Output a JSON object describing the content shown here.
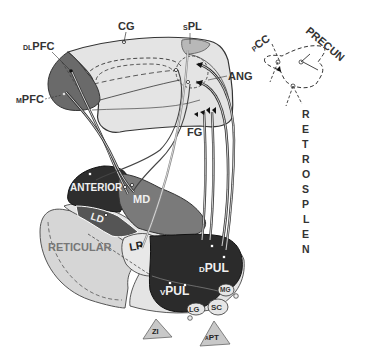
{
  "diagram": {
    "type": "anatomical-connectivity",
    "colors": {
      "cortex_fill": "#e4e4e4",
      "pfc_fill": "#6a6a6a",
      "anterior_fill": "#2e2e2e",
      "md_fill": "#7a7a7a",
      "ld_fill": "#555555",
      "lp_fill": "#e8e8e8",
      "pulvinar_fill": "#2b2b2b",
      "reticular_fill": "#d6d6d6",
      "outline": "#333333",
      "label_dark": "#333333",
      "label_light": "#f0f0f0"
    },
    "cortex_labels": {
      "cg": "CG",
      "dlpfc_prefix": "DL",
      "dlpfc": "PFC",
      "mpfc_prefix": "M",
      "mpfc": "PFC",
      "spl_prefix": "S",
      "spl": "PL",
      "ang": "ANG",
      "fg": "FG"
    },
    "inset_labels": {
      "pcc_prefix": "P",
      "pcc": "CC",
      "precun": "PRECUN",
      "retrosplen": [
        "R",
        "E",
        "T",
        "R",
        "O",
        "S",
        "P",
        "L",
        "E",
        "N"
      ]
    },
    "thalamus_labels": {
      "anterior": "ANTERIOR",
      "md": "MD",
      "ld": "LD",
      "lp": "LP",
      "reticular": "RETICULAR",
      "dpul_prefix": "D",
      "dpul": "PUL",
      "vpul_prefix": "V",
      "vpul": "PUL",
      "mg": "MG",
      "lg": "LG",
      "sc": "SC",
      "zi": "ZI",
      "apt_prefix": "A",
      "apt": "PT"
    }
  }
}
